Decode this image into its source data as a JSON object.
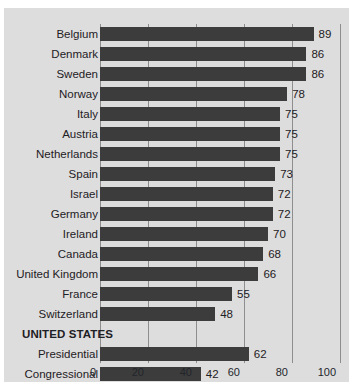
{
  "chart_data": {
    "type": "bar",
    "orientation": "horizontal",
    "title": "",
    "subtitle": "",
    "xlabel": "",
    "ylabel": "",
    "xlim": [
      0,
      100
    ],
    "xticks": [
      0,
      20,
      40,
      60,
      80,
      100
    ],
    "xtick_labels": [
      "0",
      "20",
      "40",
      "60",
      "80",
      "100"
    ],
    "grid": true,
    "legend": null,
    "categories": [
      "Belgium",
      "Denmark",
      "Sweden",
      "Norway",
      "Italy",
      "Austria",
      "Netherlands",
      "Spain",
      "Israel",
      "Germany",
      "Ireland",
      "Canada",
      "United Kingdom",
      "France",
      "Switzerland",
      "UNITED STATES",
      "Presidential",
      "Congressional"
    ],
    "values": [
      89,
      86,
      86,
      78,
      75,
      75,
      75,
      73,
      72,
      72,
      70,
      68,
      66,
      55,
      48,
      null,
      62,
      42
    ],
    "rows": [
      {
        "label": "Belgium",
        "value": 89,
        "value_text": "89",
        "group_header": false
      },
      {
        "label": "Denmark",
        "value": 86,
        "value_text": "86",
        "group_header": false
      },
      {
        "label": "Sweden",
        "value": 86,
        "value_text": "86",
        "group_header": false
      },
      {
        "label": "Norway",
        "value": 78,
        "value_text": "78",
        "group_header": false
      },
      {
        "label": "Italy",
        "value": 75,
        "value_text": "75",
        "group_header": false
      },
      {
        "label": "Austria",
        "value": 75,
        "value_text": "75",
        "group_header": false
      },
      {
        "label": "Netherlands",
        "value": 75,
        "value_text": "75",
        "group_header": false
      },
      {
        "label": "Spain",
        "value": 73,
        "value_text": "73",
        "group_header": false
      },
      {
        "label": "Israel",
        "value": 72,
        "value_text": "72",
        "group_header": false
      },
      {
        "label": "Germany",
        "value": 72,
        "value_text": "72",
        "group_header": false
      },
      {
        "label": "Ireland",
        "value": 70,
        "value_text": "70",
        "group_header": false
      },
      {
        "label": "Canada",
        "value": 68,
        "value_text": "68",
        "group_header": false
      },
      {
        "label": "United Kingdom",
        "value": 66,
        "value_text": "66",
        "group_header": false
      },
      {
        "label": "France",
        "value": 55,
        "value_text": "55",
        "group_header": false
      },
      {
        "label": "Switzerland",
        "value": 48,
        "value_text": "48",
        "group_header": false
      },
      {
        "label": "UNITED STATES",
        "value": null,
        "value_text": "",
        "group_header": true
      },
      {
        "label": "Presidential",
        "value": 62,
        "value_text": "62",
        "group_header": false
      },
      {
        "label": "Congressional",
        "value": 42,
        "value_text": "42",
        "group_header": false
      }
    ],
    "colors": {
      "bar": "#3c3c3c",
      "panel_background": "#dddddd",
      "gridline": "#8e8e8e",
      "text": "#1d2024"
    }
  }
}
